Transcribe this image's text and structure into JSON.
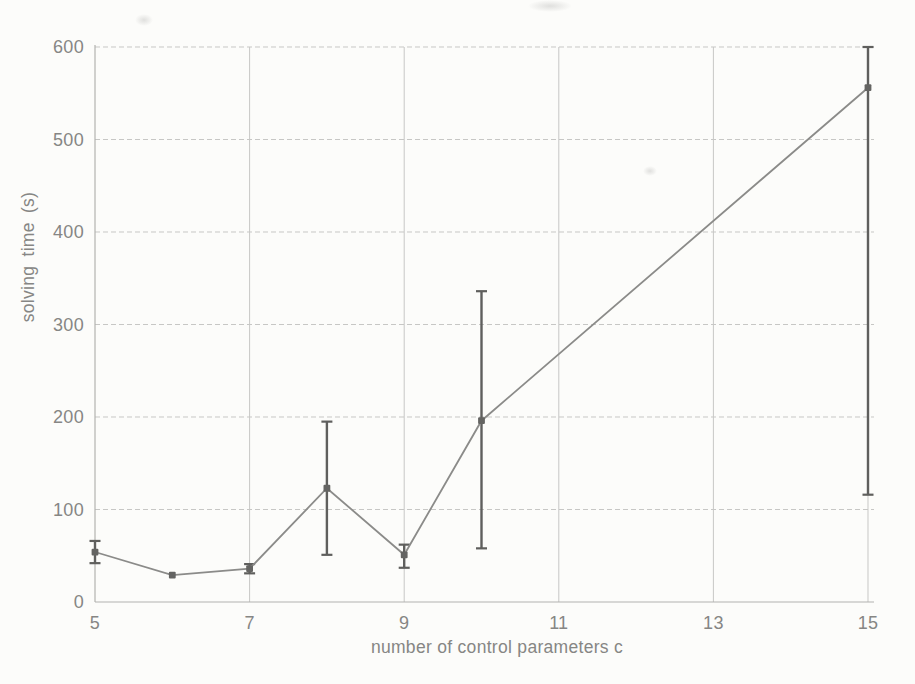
{
  "chart_data": {
    "type": "line",
    "title": "",
    "xlabel": "number of control parameters c",
    "ylabel": "solving time (s)",
    "xlim": [
      5,
      15
    ],
    "ylim": [
      0,
      600
    ],
    "x_ticks": [
      "5",
      "7",
      "9",
      "11",
      "13",
      "15"
    ],
    "y_ticks": [
      "0",
      "100",
      "200",
      "300",
      "400",
      "500",
      "600"
    ],
    "grid": true,
    "legend": false,
    "error_bars": true,
    "marker": "square",
    "series": [
      {
        "points": [
          {
            "x": 5,
            "y": 54,
            "err_low": 42,
            "err_high": 66
          },
          {
            "x": 6,
            "y": 29
          },
          {
            "x": 7,
            "y": 36,
            "err_low": 31,
            "err_high": 41
          },
          {
            "x": 8,
            "y": 123,
            "err_low": 51,
            "err_high": 195
          },
          {
            "x": 9,
            "y": 51,
            "err_low": 37,
            "err_high": 62
          },
          {
            "x": 10,
            "y": 196,
            "err_low": 58,
            "err_high": 336
          },
          {
            "x": 15,
            "y": 556,
            "err_low": 116,
            "err_high": 600
          }
        ]
      }
    ],
    "colors": {
      "line": "#8b8b89",
      "marker": "#646462",
      "error_bar": "#5f5f5d",
      "grid": "#c7c7c5",
      "axis": "#b2b2af",
      "text": "#868684",
      "background": "#fcfcfa"
    }
  }
}
